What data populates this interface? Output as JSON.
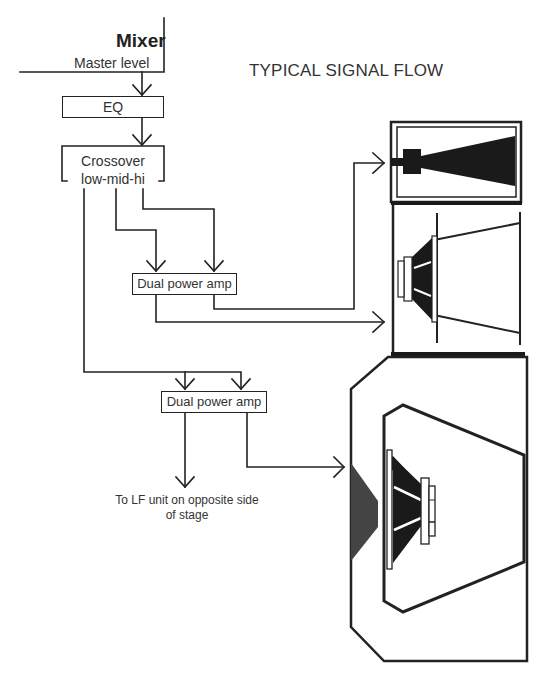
{
  "title": "TYPICAL SIGNAL FLOW",
  "mixer": {
    "label": "Mixer",
    "output_label": "Master level"
  },
  "nodes": {
    "eq": "EQ",
    "crossover_line1": "Crossover",
    "crossover_line2": "low-mid-hi",
    "amp_high_mid": "Dual power amp",
    "amp_low": "Dual power amp",
    "lf_remote": "To LF unit on opposite side of stage"
  },
  "speakers": {
    "high": "horn-driver-icon",
    "mid": "mid-cone-driver-icon",
    "low": "low-frequency-cabinet-icon"
  },
  "colors": {
    "line": "#222222",
    "text": "#333333",
    "fill_dark": "#1a1a1a",
    "fill_port": "#444444"
  }
}
